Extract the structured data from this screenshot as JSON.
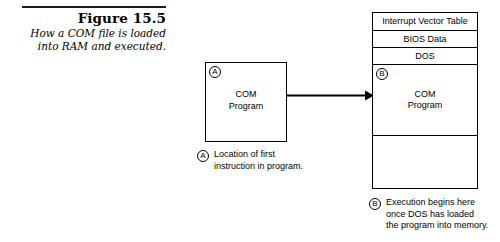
{
  "figure": {
    "number": "Figure 15.5",
    "caption_lines": [
      "How a COM file is loaded",
      "into RAM and executed."
    ]
  },
  "disk_box": {
    "marker": "A",
    "label_lines": [
      "COM",
      "Program"
    ]
  },
  "arrow": {
    "name": "load-arrow",
    "direction": "right"
  },
  "ram_map": {
    "rows": [
      {
        "label": "Interrupt Vector Table",
        "marker": ""
      },
      {
        "label": "BIOS Data",
        "marker": ""
      },
      {
        "label": "DOS",
        "marker": ""
      }
    ],
    "com_section": {
      "marker": "B",
      "label_lines": [
        "COM",
        "Program"
      ]
    },
    "free_section": {
      "label": ""
    }
  },
  "legends": [
    {
      "marker": "A",
      "lines": [
        "Location of first",
        "instruction in program."
      ]
    },
    {
      "marker": "B",
      "lines": [
        "Execution begins here",
        "once DOS has loaded",
        "the program into memory."
      ]
    }
  ],
  "colors": {
    "ink": "#000000",
    "background": "#ffffff"
  }
}
